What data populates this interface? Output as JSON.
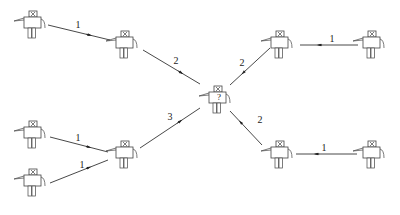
{
  "diagram": {
    "type": "robot-communication-graph",
    "nodes": [
      {
        "id": "A",
        "x": 33,
        "y": 25,
        "label": ""
      },
      {
        "id": "B",
        "x": 125,
        "y": 45,
        "label": ""
      },
      {
        "id": "C",
        "x": 33,
        "y": 135,
        "label": ""
      },
      {
        "id": "D",
        "x": 33,
        "y": 183,
        "label": ""
      },
      {
        "id": "E",
        "x": 125,
        "y": 155,
        "label": ""
      },
      {
        "id": "F",
        "x": 218,
        "y": 100,
        "label": "?"
      },
      {
        "id": "G",
        "x": 280,
        "y": 45,
        "label": ""
      },
      {
        "id": "H",
        "x": 372,
        "y": 45,
        "label": ""
      },
      {
        "id": "I",
        "x": 280,
        "y": 155,
        "label": ""
      },
      {
        "id": "J",
        "x": 372,
        "y": 155,
        "label": ""
      }
    ],
    "edges": [
      {
        "from": "A",
        "to": "B",
        "weight": "1",
        "x1": 48,
        "y1": 25,
        "x2": 110,
        "y2": 40,
        "lx": 78,
        "ly": 28
      },
      {
        "from": "B",
        "to": "F",
        "weight": "2",
        "x1": 143,
        "y1": 50,
        "x2": 200,
        "y2": 84,
        "lx": 176,
        "ly": 64
      },
      {
        "from": "H",
        "to": "G",
        "weight": "1",
        "x1": 358,
        "y1": 45,
        "x2": 300,
        "y2": 45,
        "lx": 332,
        "ly": 42
      },
      {
        "from": "G",
        "to": "F",
        "weight": "2",
        "x1": 270,
        "y1": 48,
        "x2": 230,
        "y2": 85,
        "lx": 242,
        "ly": 66
      },
      {
        "from": "C",
        "to": "B_E",
        "weight": "1",
        "x1": 50,
        "y1": 137,
        "x2": 108,
        "y2": 152,
        "lx": 78,
        "ly": 141
      },
      {
        "from": "D",
        "to": "E",
        "weight": "1",
        "x1": 50,
        "y1": 183,
        "x2": 108,
        "y2": 160,
        "lx": 82,
        "ly": 168
      },
      {
        "from": "E",
        "to": "F",
        "weight": "3",
        "x1": 140,
        "y1": 148,
        "x2": 200,
        "y2": 108,
        "lx": 170,
        "ly": 120
      },
      {
        "from": "J",
        "to": "I",
        "weight": "1",
        "x1": 357,
        "y1": 154,
        "x2": 296,
        "y2": 154,
        "lx": 324,
        "ly": 151
      },
      {
        "from": "I",
        "to": "F",
        "weight": "2",
        "x1": 262,
        "y1": 145,
        "x2": 230,
        "y2": 111,
        "lx": 260,
        "ly": 123
      }
    ]
  }
}
